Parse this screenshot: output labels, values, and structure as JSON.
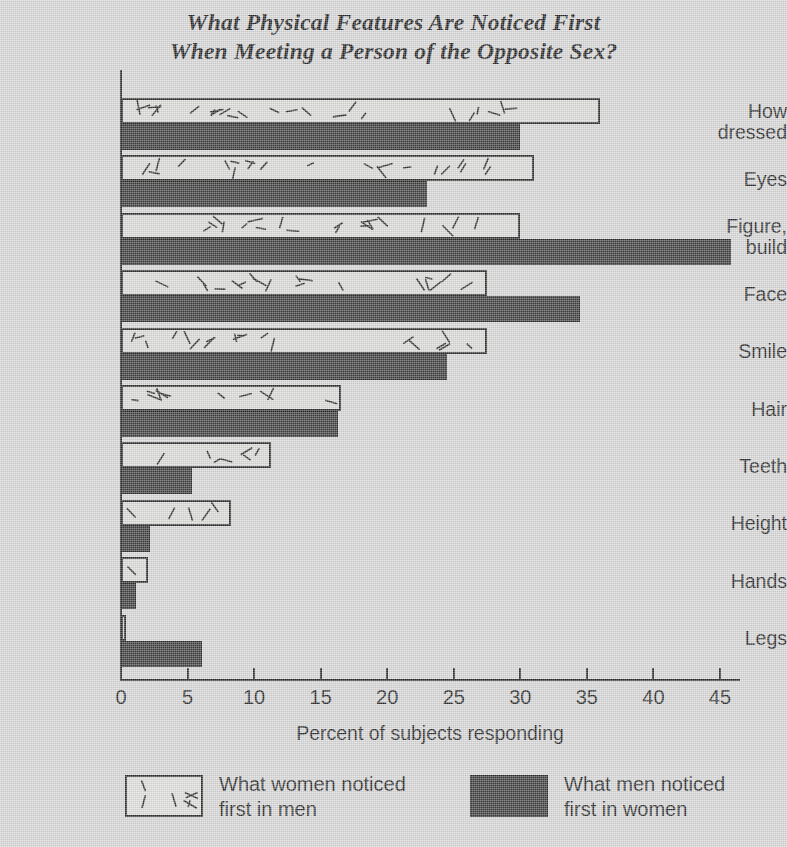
{
  "chart_data": {
    "type": "bar",
    "orientation": "horizontal",
    "title": "What Physical Features Are Noticed First When Meeting a Person of the Opposite Sex?",
    "title_line1": "What Physical Features Are Noticed First",
    "title_line2": "When Meeting a Person of the Opposite Sex?",
    "xlabel": "Percent of subjects responding",
    "ylabel": "",
    "xlim": [
      0,
      47
    ],
    "xticks": [
      0,
      5,
      10,
      15,
      20,
      25,
      30,
      35,
      40,
      45
    ],
    "xtick_labels": [
      "0",
      "5",
      "10",
      "15",
      "20",
      "25",
      "30",
      "35",
      "40",
      "45"
    ],
    "grid": false,
    "legend_position": "bottom",
    "categories": [
      "How\ndressed",
      "Eyes",
      "Figure,\nbuild",
      "Face",
      "Smile",
      "Hair",
      "Teeth",
      "Height",
      "Hands",
      "Legs"
    ],
    "series": [
      {
        "name": "What women noticed\nfirst in men",
        "key": "women",
        "style": "hatched",
        "color": "#d8d8d6",
        "edge_color": "#1a1a1a",
        "values": [
          36,
          31,
          30,
          27.5,
          27.5,
          16.5,
          11.3,
          8.3,
          2.0,
          0.4
        ]
      },
      {
        "name": "What men noticed\nfirst in women",
        "key": "men",
        "style": "solid",
        "color": "#2a2a2a",
        "edge_color": "#151515",
        "values": [
          30,
          23,
          45.8,
          34.5,
          24.5,
          16.3,
          5.3,
          2.2,
          1.1,
          6.1
        ]
      }
    ]
  },
  "legend": {
    "items": [
      {
        "label": "What women noticed\nfirst in men",
        "swatch": "hatched-swatch"
      },
      {
        "label": "What men noticed\nfirst in women",
        "swatch": "solid-dark-swatch"
      }
    ]
  },
  "colors": {
    "background": "#d4d4d4",
    "ink": "#141414",
    "bar_dark": "#2a2a2a",
    "bar_light": "#d8d8d6"
  }
}
